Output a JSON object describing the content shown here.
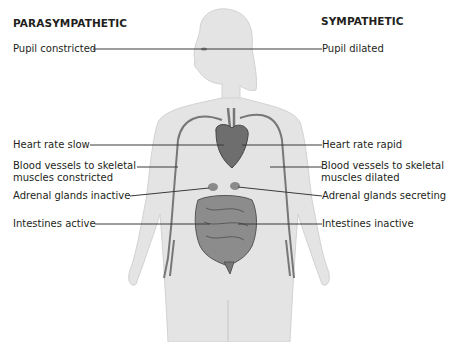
{
  "diagram": {
    "headings": {
      "left": "PARASYMPATHETIC",
      "right": "SYMPATHETIC"
    },
    "parasympathetic_labels": [
      {
        "text": "Pupil constricted"
      },
      {
        "text": "Heart rate slow"
      },
      {
        "line1": "Blood vessels to skeletal",
        "line2": "muscles constricted"
      },
      {
        "text": "Adrenal glands inactive"
      },
      {
        "text": "Intestines active"
      }
    ],
    "sympathetic_labels": [
      {
        "text": "Pupil dilated"
      },
      {
        "text": "Heart rate rapid"
      },
      {
        "line1": "Blood vessels to skeletal",
        "line2": "muscles dilated"
      },
      {
        "text": "Adrenal glands secreting"
      },
      {
        "text": "Intestines inactive"
      }
    ],
    "figure": "human-body-illustration",
    "colors": {
      "body_fill": "#e4e4e4",
      "body_edge": "#c8c8c8",
      "organ": "#6e6e6e",
      "leader_line": "#3a3a3a",
      "text": "#231f20"
    }
  }
}
